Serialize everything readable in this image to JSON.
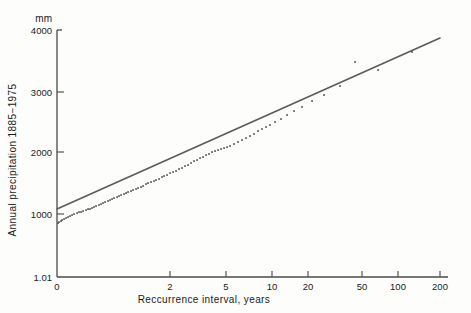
{
  "figure": {
    "unit_label": "mm",
    "y_axis_title": "Annual precipitation 1885−1975",
    "x_axis_title": "Reccurrence interval, years"
  },
  "chart_data": {
    "type": "scatter",
    "title": "",
    "subtitle": "",
    "xlabel": "Reccurrence interval, years",
    "ylabel": "Annual precipitation 1885−1975",
    "yunit": "mm",
    "grid": false,
    "legend": "none",
    "x_scale": "gumbel-probability",
    "y_scale": "linear",
    "xlim": [
      0,
      200
    ],
    "ylim": [
      1.01,
      4000
    ],
    "x_ticks": [
      {
        "label": "0",
        "value": 0,
        "px": 57
      },
      {
        "label": "2",
        "value": 2,
        "px": 170
      },
      {
        "label": "5",
        "value": 5,
        "px": 226
      },
      {
        "label": "10",
        "value": 10,
        "px": 272
      },
      {
        "label": "20",
        "value": 20,
        "px": 308
      },
      {
        "label": "50",
        "value": 50,
        "px": 362
      },
      {
        "label": "100",
        "value": 100,
        "px": 398
      },
      {
        "label": "200",
        "value": 200,
        "px": 440
      }
    ],
    "y_ticks": [
      {
        "label": "4000",
        "value": 4000,
        "px": 30
      },
      {
        "label": "3000",
        "value": 3000,
        "px": 92
      },
      {
        "label": "2000",
        "value": 2000,
        "px": 152
      },
      {
        "label": "1000",
        "value": 1000,
        "px": 214
      },
      {
        "label": "1.01",
        "value": 1.01,
        "px": 277
      }
    ],
    "fit_line": {
      "x_px": [
        57,
        440
      ],
      "y_px": [
        209,
        38
      ],
      "y_start_value": 1090,
      "y_end_value": 3860
    },
    "series": [
      {
        "name": "Annual precipitation",
        "n_points": 91,
        "points_px": [
          [
            58,
            223
          ],
          [
            59,
            222
          ],
          [
            61,
            221
          ],
          [
            62,
            220
          ],
          [
            64,
            219
          ],
          [
            66,
            218
          ],
          [
            68,
            217
          ],
          [
            70,
            216
          ],
          [
            72,
            215
          ],
          [
            74,
            214
          ],
          [
            77,
            213
          ],
          [
            79,
            212
          ],
          [
            81,
            212
          ],
          [
            83,
            211
          ],
          [
            86,
            210
          ],
          [
            88,
            209
          ],
          [
            90,
            209
          ],
          [
            92,
            208
          ],
          [
            94,
            207
          ],
          [
            96,
            206
          ],
          [
            99,
            205
          ],
          [
            101,
            204
          ],
          [
            103,
            203
          ],
          [
            105,
            202
          ],
          [
            108,
            201
          ],
          [
            110,
            200
          ],
          [
            112,
            199
          ],
          [
            114,
            198
          ],
          [
            117,
            197
          ],
          [
            119,
            196
          ],
          [
            121,
            195
          ],
          [
            124,
            194
          ],
          [
            126,
            193
          ],
          [
            128,
            192
          ],
          [
            131,
            191
          ],
          [
            133,
            190
          ],
          [
            136,
            189
          ],
          [
            138,
            188
          ],
          [
            141,
            187
          ],
          [
            143,
            186
          ],
          [
            146,
            184
          ],
          [
            148,
            183
          ],
          [
            151,
            182
          ],
          [
            154,
            181
          ],
          [
            156,
            180
          ],
          [
            159,
            179
          ],
          [
            162,
            177
          ],
          [
            164,
            176
          ],
          [
            167,
            175
          ],
          [
            170,
            173
          ],
          [
            173,
            172
          ],
          [
            176,
            171
          ],
          [
            179,
            169
          ],
          [
            182,
            168
          ],
          [
            185,
            166
          ],
          [
            188,
            165
          ],
          [
            191,
            163
          ],
          [
            194,
            161
          ],
          [
            197,
            160
          ],
          [
            200,
            158
          ],
          [
            203,
            157
          ],
          [
            206,
            155
          ],
          [
            209,
            154
          ],
          [
            212,
            152
          ],
          [
            215,
            151
          ],
          [
            218,
            150
          ],
          [
            221,
            149
          ],
          [
            224,
            148
          ],
          [
            227,
            147
          ],
          [
            230,
            146
          ],
          [
            234,
            144
          ],
          [
            238,
            142
          ],
          [
            242,
            140
          ],
          [
            246,
            138
          ],
          [
            250,
            136
          ],
          [
            254,
            134
          ],
          [
            258,
            131
          ],
          [
            262,
            129
          ],
          [
            266,
            127
          ],
          [
            270,
            125
          ],
          [
            275,
            122
          ],
          [
            281,
            119
          ],
          [
            287,
            115
          ],
          [
            294,
            111
          ],
          [
            302,
            107
          ],
          [
            312,
            101
          ],
          [
            324,
            95
          ],
          [
            340,
            86
          ],
          [
            355,
            62
          ],
          [
            378,
            70
          ],
          [
            412,
            52
          ]
        ],
        "note_outlier_px": [
          355,
          62
        ]
      }
    ]
  }
}
